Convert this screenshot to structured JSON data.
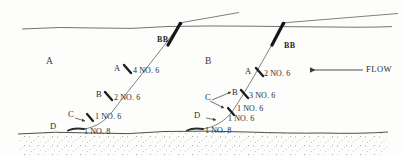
{
  "figure": {
    "background_color": "#fdfdfb",
    "line_color": "#4a4a4a",
    "ink_color": "#2a2a2a"
  },
  "water": {
    "surface_label": "water-surface",
    "seabed_label": "seabed"
  },
  "flow": {
    "label": "FLOW",
    "direction": "left"
  },
  "zones": [
    {
      "label": "A",
      "x": 48,
      "y": 60
    },
    {
      "label": "B",
      "x": 207,
      "y": 60
    }
  ],
  "cables": [
    {
      "name": "left-cable",
      "anchor_label": "BB",
      "nodes": [
        {
          "node": "A",
          "bars": "4 NO. 6"
        },
        {
          "node": "B",
          "bars": "2 NO. 6"
        },
        {
          "node": "C",
          "bars": "1 NO. 6"
        },
        {
          "node": "D",
          "bars": "1 NO. 8"
        }
      ]
    },
    {
      "name": "right-cable",
      "anchor_label": "BB",
      "nodes": [
        {
          "node": "A",
          "bars": "2 NO. 6"
        },
        {
          "node": "B",
          "bars": "3 NO. 6"
        },
        {
          "node": "C",
          "bars": "1 NO. 6"
        },
        {
          "node": "C2",
          "bars": "1 NO. 6"
        },
        {
          "node": "D",
          "bars": "1 NO. 8"
        }
      ]
    }
  ],
  "left_labels": {
    "zone_a": "A",
    "node_a": "A",
    "bars_a": "4 NO. 6",
    "node_b": "B",
    "bars_b": "2 NO. 6",
    "node_c": "C",
    "bars_c": "1 NO. 6",
    "node_d": "D",
    "bars_d": "1 NO. 8",
    "bb": "BB"
  },
  "right_labels": {
    "zone_b": "B",
    "node_a": "A",
    "bars_a": "2 NO. 6",
    "node_b": "B",
    "bars_b": "3 NO. 6",
    "node_c": "C",
    "bars_c1": "1 NO. 6",
    "bars_c2": "1 NO. 6",
    "node_d": "D",
    "bars_d": "1 NO. 8",
    "bb": "BB"
  }
}
